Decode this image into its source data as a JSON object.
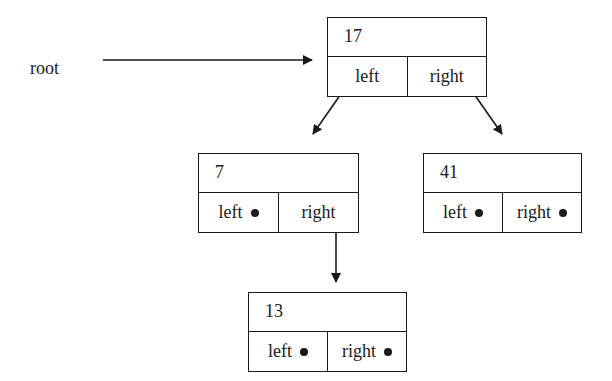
{
  "diagram": {
    "type": "binary-search-tree",
    "root_label": "root",
    "nodes": {
      "n17": {
        "value": "17",
        "left": "left",
        "right": "right",
        "left_null": false,
        "right_null": false
      },
      "n7": {
        "value": "7",
        "left": "left",
        "right": "right",
        "left_null": true,
        "right_null": false
      },
      "n41": {
        "value": "41",
        "left": "left",
        "right": "right",
        "left_null": true,
        "right_null": true
      },
      "n13": {
        "value": "13",
        "left": "left",
        "right": "right",
        "left_null": true,
        "right_null": true
      }
    },
    "edges": [
      {
        "from": "root",
        "to": "17"
      },
      {
        "from": "17.left",
        "to": "7"
      },
      {
        "from": "17.right",
        "to": "41"
      },
      {
        "from": "7.right",
        "to": "13"
      }
    ],
    "null_marker": "dot"
  }
}
